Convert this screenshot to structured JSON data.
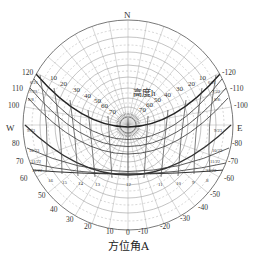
{
  "compass": {
    "north": "N",
    "west": "W",
    "east": "E"
  },
  "altitude_axis": {
    "label": "高度h",
    "ticks": [
      10,
      20,
      30,
      40,
      50,
      60,
      70
    ]
  },
  "azimuth_axis": {
    "label": "方位角A",
    "left_ticks": [
      120,
      110,
      100,
      80,
      70,
      60,
      50,
      40,
      30,
      20,
      10
    ],
    "right_ticks": [
      -120,
      -110,
      -100,
      -80,
      -70,
      -60,
      -50,
      -40,
      -30,
      -20,
      -10
    ],
    "bottom_ticks": [
      10,
      0,
      -10
    ]
  },
  "date_labels": {
    "left": [
      "6/21",
      "7/23",
      "8/8",
      "9/23",
      "10/23",
      "11/22",
      "12/22"
    ],
    "right": [
      "6/21",
      "7/23",
      "8/8",
      "9/23",
      "10/23",
      "11/22",
      "12/22"
    ]
  },
  "hour_labels": [
    "16",
    "15",
    "14",
    "13",
    "12",
    "11",
    "10",
    "9",
    "8"
  ],
  "colors": {
    "line": "#444444",
    "grid": "#888888",
    "background": "#ffffff"
  }
}
